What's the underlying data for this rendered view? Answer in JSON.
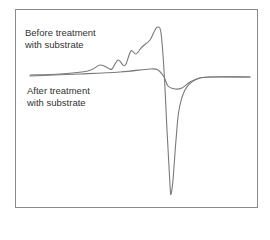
{
  "chart_data": {
    "type": "line",
    "title": "",
    "xlabel": "",
    "ylabel": "",
    "grid": false,
    "legend_position": "inline-annotations",
    "annotations": [
      {
        "line1": "Before treatment",
        "line2": "with substrate",
        "series": "Before treatment with substrate"
      },
      {
        "line1": "After treatment",
        "line2": "with substrate",
        "series": "After treatment with substrate"
      }
    ],
    "series": [
      {
        "name": "Before treatment with substrate",
        "color": "#7a7a7a",
        "shape": "derivative-like spectrum: flat baseline, series of increasing positive bumps culminating in a sharp maximum, then a deep narrow negative minimum, returning to baseline",
        "points_px": [
          [
            30,
            75
          ],
          [
            60,
            74
          ],
          [
            88,
            71
          ],
          [
            100,
            65
          ],
          [
            108,
            68
          ],
          [
            112,
            69
          ],
          [
            118,
            60
          ],
          [
            123,
            65
          ],
          [
            126,
            64
          ],
          [
            131,
            51
          ],
          [
            136,
            54
          ],
          [
            142,
            47
          ],
          [
            150,
            40
          ],
          [
            155,
            30
          ],
          [
            158,
            27
          ],
          [
            161,
            33
          ],
          [
            164,
            70
          ],
          [
            167,
            130
          ],
          [
            170,
            185
          ],
          [
            171,
            194
          ],
          [
            173,
            180
          ],
          [
            176,
            140
          ],
          [
            179,
            110
          ],
          [
            185,
            90
          ],
          [
            195,
            80
          ],
          [
            210,
            77
          ],
          [
            250,
            77
          ]
        ]
      },
      {
        "name": "After treatment with substrate",
        "color": "#7a7a7a",
        "shape": "weak derivative-like signal: slight positive rise then shallow broad negative dip, returning to baseline",
        "points_px": [
          [
            30,
            76
          ],
          [
            80,
            74
          ],
          [
            120,
            72
          ],
          [
            150,
            69
          ],
          [
            158,
            70
          ],
          [
            164,
            77
          ],
          [
            168,
            86
          ],
          [
            175,
            89
          ],
          [
            182,
            88
          ],
          [
            190,
            82
          ],
          [
            200,
            78
          ],
          [
            215,
            77
          ],
          [
            250,
            77
          ]
        ]
      }
    ]
  },
  "labels": {
    "before_line1": "Before treatment",
    "before_line2": "with substrate",
    "after_line1": "After treatment",
    "after_line2": "with substrate"
  }
}
